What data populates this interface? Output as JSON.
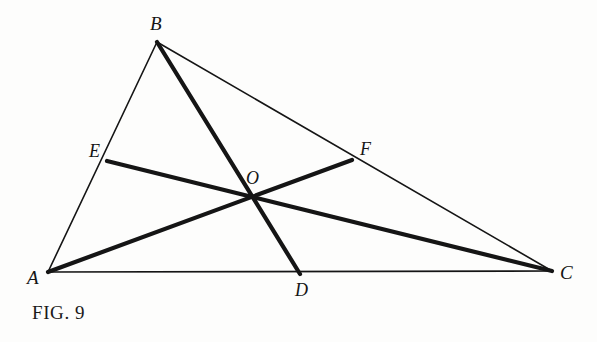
{
  "figure": {
    "caption": "FIG. 9",
    "background_color": "#fdfdfc",
    "ink_color": "#151515",
    "canvas": {
      "width": 597,
      "height": 342
    },
    "labels": {
      "A": "A",
      "B": "B",
      "C": "C",
      "D": "D",
      "E": "E",
      "F": "F",
      "O": "O"
    },
    "points": {
      "A": {
        "x": 48,
        "y": 272,
        "role": "triangle-vertex"
      },
      "B": {
        "x": 157,
        "y": 42,
        "role": "triangle-vertex"
      },
      "C": {
        "x": 552,
        "y": 271,
        "role": "triangle-vertex"
      },
      "D": {
        "x": 300,
        "y": 274,
        "role": "point-on-side-AC"
      },
      "E": {
        "x": 107,
        "y": 161,
        "role": "point-on-side-AB"
      },
      "F": {
        "x": 352,
        "y": 160,
        "role": "point-on-side-BC"
      },
      "O": {
        "x": 252,
        "y": 198,
        "role": "cevian-intersection"
      }
    },
    "segments": [
      {
        "name": "side-AB",
        "from": "A",
        "to": "B",
        "weight": "thin",
        "stroke_width": 1.6
      },
      {
        "name": "side-BC",
        "from": "B",
        "to": "C",
        "weight": "thin",
        "stroke_width": 1.6
      },
      {
        "name": "side-AC",
        "from": "A",
        "to": "C",
        "weight": "thin",
        "stroke_width": 1.6
      },
      {
        "name": "cevian-BD",
        "from": "B",
        "to": "D",
        "weight": "thick",
        "stroke_width": 4.2
      },
      {
        "name": "cevian-AF",
        "from": "A",
        "to": "F",
        "weight": "thick",
        "stroke_width": 4.2
      },
      {
        "name": "cevian-CE",
        "from": "C",
        "to": "E",
        "weight": "thick",
        "stroke_width": 4.2
      }
    ]
  },
  "chart_data": {
    "type": "diagram",
    "title": "FIG. 9",
    "vertices": [
      {
        "label": "A",
        "x": 48,
        "y": 272
      },
      {
        "label": "B",
        "x": 157,
        "y": 42
      },
      {
        "label": "C",
        "x": 552,
        "y": 271
      }
    ],
    "cevian_feet": [
      {
        "label": "D",
        "x": 300,
        "y": 274,
        "on_side": "AC"
      },
      {
        "label": "E",
        "x": 107,
        "y": 161,
        "on_side": "AB"
      },
      {
        "label": "F",
        "x": 352,
        "y": 160,
        "on_side": "BC"
      }
    ],
    "intersection": {
      "label": "O",
      "x": 252,
      "y": 198
    },
    "lines_thin": [
      "AB",
      "BC",
      "AC"
    ],
    "lines_thick": [
      "BD",
      "AF",
      "CE"
    ]
  }
}
